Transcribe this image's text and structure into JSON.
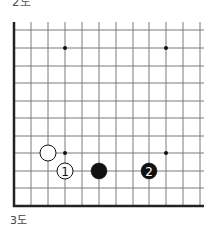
{
  "figure": {
    "top_label": "2도",
    "caption": "3도"
  },
  "board": {
    "columns_x": [
      14,
      31,
      48,
      65,
      82,
      99,
      116,
      133,
      149,
      166,
      183,
      200
    ],
    "rows_y": [
      30,
      48,
      66,
      83,
      101,
      118,
      136,
      153,
      171,
      188,
      206
    ],
    "right_extend_x": 204,
    "top_extend_y": 22,
    "line_color": "#7a7a7a",
    "edge_color": "#222222",
    "star_points": [
      {
        "col": 3,
        "row": 1
      },
      {
        "col": 9,
        "row": 1
      },
      {
        "col": 3,
        "row": 7
      },
      {
        "col": 9,
        "row": 7
      }
    ],
    "stones": [
      {
        "color": "white",
        "col": 2,
        "row": 7,
        "label": ""
      },
      {
        "color": "white",
        "col": 3,
        "row": 8,
        "label": "1"
      },
      {
        "color": "black",
        "col": 5,
        "row": 8,
        "label": ""
      },
      {
        "color": "black",
        "col": 8,
        "row": 8,
        "label": "2"
      }
    ]
  }
}
